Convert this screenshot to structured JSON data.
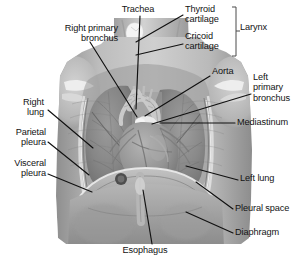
{
  "figure": {
    "type": "anatomical-illustration",
    "rendering": "grayscale photographic illustration"
  },
  "labels": [
    {
      "id": "trachea",
      "text": "Trachea",
      "align": "center",
      "x": 110,
      "y": 4,
      "w": 56
    },
    {
      "id": "right-primary-bronchus",
      "text": "Right primary\nbronchus",
      "align": "right",
      "x": 8,
      "y": 23,
      "w": 110
    },
    {
      "id": "thyroid-cartilage",
      "text": "Thyroid\ncartilage",
      "align": "left",
      "x": 185,
      "y": 4,
      "w": 58
    },
    {
      "id": "cricoid-cartilage",
      "text": "Cricoid\ncartilage",
      "align": "left",
      "x": 185,
      "y": 31,
      "w": 58
    },
    {
      "id": "larynx",
      "text": "Larynx",
      "align": "left",
      "x": 240,
      "y": 22,
      "w": 44
    },
    {
      "id": "aorta",
      "text": "Aorta",
      "align": "left",
      "x": 212,
      "y": 66,
      "w": 40
    },
    {
      "id": "left-primary-bronchus",
      "text": "Left\nprimary\nbronchus",
      "align": "left",
      "x": 253,
      "y": 72,
      "w": 52
    },
    {
      "id": "mediastinum",
      "text": "Mediastinum",
      "align": "left",
      "x": 237,
      "y": 117,
      "w": 70
    },
    {
      "id": "right-lung",
      "text": "Right\nlung",
      "align": "right",
      "x": 2,
      "y": 97,
      "w": 42
    },
    {
      "id": "parietal-pleura",
      "text": "Parietal\npleura",
      "align": "right",
      "x": 2,
      "y": 127,
      "w": 44
    },
    {
      "id": "visceral-pleura",
      "text": "Visceral\npleura",
      "align": "right",
      "x": 2,
      "y": 158,
      "w": 44
    },
    {
      "id": "left-lung",
      "text": "Left lung",
      "align": "left",
      "x": 240,
      "y": 173,
      "w": 62
    },
    {
      "id": "pleural-space",
      "text": "Pleural space",
      "align": "left",
      "x": 235,
      "y": 203,
      "w": 72
    },
    {
      "id": "diaphragm",
      "text": "Diaphragm",
      "align": "left",
      "x": 235,
      "y": 227,
      "w": 66
    },
    {
      "id": "esophagus",
      "text": "Esophagus",
      "align": "center",
      "x": 112,
      "y": 245,
      "w": 66
    }
  ],
  "leader_lines": [
    {
      "id": "leader-trachea",
      "from": [
        140,
        16
      ],
      "to": [
        136,
        109
      ]
    },
    {
      "id": "leader-right-primary-bronchus",
      "from": [
        90,
        42
      ],
      "to": [
        137,
        117
      ]
    },
    {
      "id": "leader-thyroid-cartilage",
      "from": [
        183,
        15
      ],
      "to": [
        136,
        42
      ]
    },
    {
      "id": "leader-cricoid-cartilage",
      "from": [
        183,
        44
      ],
      "to": [
        136,
        55
      ]
    },
    {
      "id": "leader-aorta",
      "from": [
        210,
        76
      ],
      "to": [
        145,
        116
      ]
    },
    {
      "id": "leader-left-primary-bronchus",
      "from": [
        251,
        94
      ],
      "to": [
        152,
        124
      ]
    },
    {
      "id": "leader-mediastinum",
      "from": [
        235,
        123
      ],
      "to": [
        160,
        123
      ]
    },
    {
      "id": "leader-right-lung",
      "from": [
        48,
        110
      ],
      "to": [
        93,
        148
      ]
    },
    {
      "id": "leader-parietal-pleura",
      "from": [
        48,
        142
      ],
      "to": [
        89,
        175
      ]
    },
    {
      "id": "leader-visceral-pleura",
      "from": [
        48,
        174
      ],
      "to": [
        92,
        192
      ]
    },
    {
      "id": "leader-left-lung",
      "from": [
        238,
        180
      ],
      "to": [
        186,
        166
      ]
    },
    {
      "id": "leader-pleural-space",
      "from": [
        233,
        209
      ],
      "to": [
        196,
        182
      ]
    },
    {
      "id": "leader-diaphragm",
      "from": [
        233,
        233
      ],
      "to": [
        186,
        212
      ]
    },
    {
      "id": "leader-esophagus",
      "from": [
        152,
        244
      ],
      "to": [
        143,
        190
      ]
    }
  ],
  "bracket": {
    "id": "larynx-bracket",
    "x": 236,
    "top": 7,
    "bottom": 56,
    "tick": 4,
    "stem_y": 31
  },
  "colors": {
    "text": "#131313",
    "leader": "#101010",
    "background": "#ffffff",
    "tissue_light": "#c9c9c9",
    "tissue_mid": "#a6a6a6",
    "tissue_dark": "#7d7d7d",
    "tissue_darkest": "#555555",
    "cartilage": "#f2f2f2"
  }
}
